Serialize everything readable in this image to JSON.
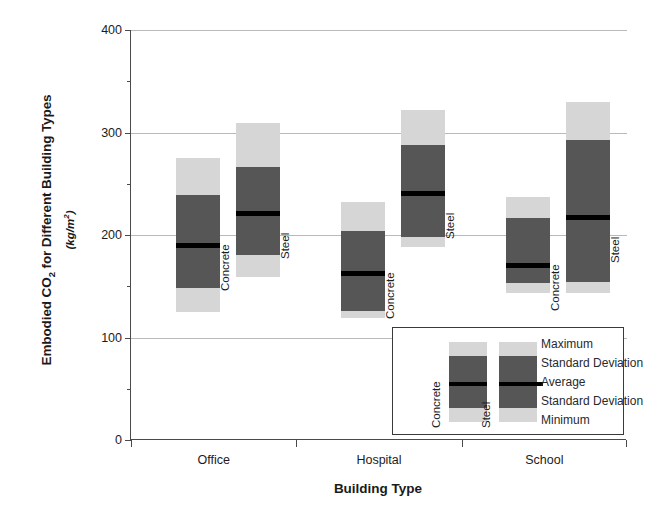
{
  "chart_data": {
    "type": "bar",
    "title": "",
    "ylabel": "Embodied CO2 for Different Building Types",
    "ylabel_units": "(kg/m2)",
    "xlabel": "Building Type",
    "categories": [
      "Office",
      "Hospital",
      "School"
    ],
    "ylim": [
      0,
      400
    ],
    "yticks": [
      0,
      100,
      200,
      300,
      400
    ],
    "ytick_labels": [
      "0",
      "100",
      "200",
      "300",
      "400"
    ],
    "yminor_ticks": [
      50,
      150,
      250,
      350
    ],
    "grid": "horizontal",
    "legend_position": "bottom-right",
    "material_labels": {
      "concrete": "Concrete",
      "steel": "Steel"
    },
    "series": [
      {
        "name": "Concrete",
        "points": [
          {
            "category": "Office",
            "minimum": 125,
            "sd_low": 148,
            "average": 190,
            "sd_high": 239,
            "maximum": 275
          },
          {
            "category": "Hospital",
            "minimum": 119,
            "sd_low": 126,
            "average": 163,
            "sd_high": 204,
            "maximum": 232
          },
          {
            "category": "School",
            "minimum": 143,
            "sd_low": 153,
            "average": 171,
            "sd_high": 217,
            "maximum": 237
          }
        ]
      },
      {
        "name": "Steel",
        "points": [
          {
            "category": "Office",
            "minimum": 159,
            "sd_low": 180,
            "average": 221,
            "sd_high": 266,
            "maximum": 309
          },
          {
            "category": "Hospital",
            "minimum": 188,
            "sd_low": 198,
            "average": 241,
            "sd_high": 288,
            "maximum": 322
          },
          {
            "category": "School",
            "minimum": 143,
            "sd_low": 154,
            "average": 218,
            "sd_high": 293,
            "maximum": 330
          }
        ]
      }
    ],
    "legend": {
      "entries": [
        "Maximum",
        "Standard Deviation",
        "Average",
        "Standard Deviation",
        "Minimum"
      ],
      "sample_labels": [
        "Concrete",
        "Steel"
      ]
    },
    "colors": {
      "range_fill": "#d6d6d6",
      "sd_fill": "#565656",
      "average_line": "#000000",
      "gridline": "#b9b9b9",
      "axis": "#4a4a4a",
      "background": "#ffffff"
    }
  }
}
